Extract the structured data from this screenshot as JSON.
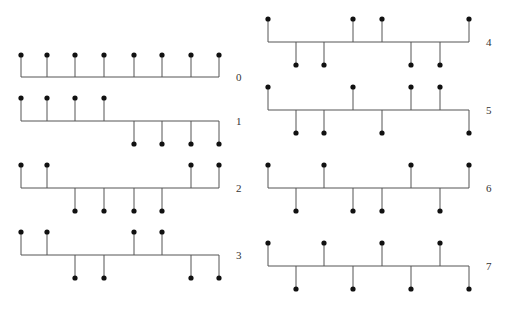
{
  "colors": {
    "line": "#555555",
    "dot": "#111111",
    "label": "#333333",
    "background": "#ffffff"
  },
  "columns": [
    {
      "x": [
        21,
        47,
        75,
        104,
        134,
        162,
        191,
        219
      ],
      "label_x": 236
    },
    {
      "x": [
        268,
        296,
        324,
        353,
        382,
        411,
        440,
        469
      ],
      "label_x": 486
    }
  ],
  "functions": [
    {
      "index": "0",
      "column": 0,
      "baseline": 77,
      "amplitude": 22,
      "values": [
        1,
        1,
        1,
        1,
        1,
        1,
        1,
        1
      ]
    },
    {
      "index": "1",
      "column": 0,
      "baseline": 121,
      "amplitude": 23,
      "values": [
        1,
        1,
        1,
        1,
        -1,
        -1,
        -1,
        -1
      ]
    },
    {
      "index": "2",
      "column": 0,
      "baseline": 188,
      "amplitude": 23,
      "values": [
        1,
        1,
        -1,
        -1,
        -1,
        -1,
        1,
        1
      ]
    },
    {
      "index": "3",
      "column": 0,
      "baseline": 255,
      "amplitude": 23,
      "values": [
        1,
        1,
        -1,
        -1,
        1,
        1,
        -1,
        -1
      ]
    },
    {
      "index": "4",
      "column": 1,
      "baseline": 42,
      "amplitude": 23,
      "values": [
        1,
        -1,
        -1,
        1,
        1,
        -1,
        -1,
        1
      ]
    },
    {
      "index": "5",
      "column": 1,
      "baseline": 110,
      "amplitude": 23,
      "values": [
        1,
        -1,
        -1,
        1,
        -1,
        1,
        1,
        -1
      ]
    },
    {
      "index": "6",
      "column": 1,
      "baseline": 188,
      "amplitude": 23,
      "values": [
        1,
        -1,
        1,
        -1,
        -1,
        1,
        -1,
        1
      ]
    },
    {
      "index": "7",
      "column": 1,
      "baseline": 266,
      "amplitude": 23,
      "values": [
        1,
        -1,
        1,
        -1,
        1,
        -1,
        1,
        -1
      ]
    }
  ]
}
